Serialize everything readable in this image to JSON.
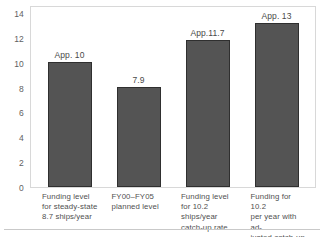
{
  "chart_data": {
    "type": "bar",
    "title": "",
    "subtitle": "",
    "xlabel": "",
    "ylabel": "",
    "ylim": [
      0,
      14.6
    ],
    "grid": false,
    "legend": "none",
    "y_ticks": [
      "14",
      "12",
      "10",
      "8",
      "6",
      "4",
      "2",
      "0"
    ],
    "y_tick_values": [
      14,
      12,
      10,
      8,
      6,
      4,
      2,
      0
    ],
    "categories": [
      "Funding level for steady-state 8.7 ships/year",
      "FY00–FY05 planned level",
      "Funding level for 10.2 ships/year catch-up rate",
      "Funding for 10.2 per year with adjusted catch-up mix"
    ],
    "category_lines": [
      [
        "Funding level",
        "for steady-state",
        "8.7 ships/year"
      ],
      [
        "FY00–FY05",
        "planned level"
      ],
      [
        "Funding level",
        "for 10.2 ships/year",
        "catch-up rate"
      ],
      [
        "Funding for 10.2",
        "per year with ad-",
        "justed catch-up mix"
      ]
    ],
    "values": [
      10.1,
      8.1,
      11.9,
      13.3
    ],
    "data_labels": [
      "App. 10",
      "7.9",
      "App.11.7",
      "App. 13"
    ],
    "bar_color": "#545454",
    "bar_border_color": "#2f2f2f",
    "axis_color": "#d8d8d8",
    "text_color": "#4a4a4a"
  }
}
